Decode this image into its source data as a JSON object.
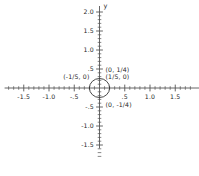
{
  "chart_data": {
    "type": "scatter",
    "title": "",
    "xlabel": "x",
    "ylabel": "y",
    "xlim": [
      -1.8,
      1.8
    ],
    "ylim": [
      -1.8,
      2.0
    ],
    "grid": false,
    "legend": "none",
    "curve": {
      "name": "ellipse",
      "shape": "ellipse",
      "center": [
        0,
        0
      ],
      "semi_axis_x": 0.2,
      "semi_axis_y": 0.25,
      "equation": "25x^2 + 16y^2 = 1"
    },
    "annotations": [
      {
        "id": "top-vertex",
        "text": "(0, 1/4)",
        "x": 0,
        "y": 0.25
      },
      {
        "id": "left-vertex",
        "text": "(-1/5, 0)",
        "x": -0.2,
        "y": 0
      },
      {
        "id": "right-vertex",
        "text": "(1/5, 0)",
        "x": 0.2,
        "y": 0
      },
      {
        "id": "bottom-vertex",
        "text": "(0, -1/4)",
        "x": 0,
        "y": -0.25
      }
    ],
    "x_ticks": [
      {
        "value": -1.5,
        "label": "-1.5",
        "major": true
      },
      {
        "value": -1.0,
        "label": "-1.0",
        "major": true
      },
      {
        "value": -0.5,
        "label": "-.5",
        "major": true
      },
      {
        "value": 0.5,
        "label": ".5",
        "major": true
      },
      {
        "value": 1.0,
        "label": "1.0",
        "major": true
      },
      {
        "value": 1.5,
        "label": "1.5",
        "major": true
      }
    ],
    "y_ticks": [
      {
        "value": 2.0,
        "label": "2.0",
        "major": true
      },
      {
        "value": 1.5,
        "label": "1.5",
        "major": true
      },
      {
        "value": 1.0,
        "label": "1.0",
        "major": true
      },
      {
        "value": 0.5,
        "label": ".5",
        "major": true
      },
      {
        "value": -0.5,
        "label": "-.5",
        "major": true
      },
      {
        "value": -1.0,
        "label": "-1.0",
        "major": true
      },
      {
        "value": -1.5,
        "label": "-1.5",
        "major": true
      }
    ],
    "minor_tick_step": 0.1,
    "axis_color": "#555555",
    "curve_color": "#333333",
    "background_color": "#ffffff"
  },
  "axis_labels": {
    "x": "x",
    "y": "y"
  }
}
